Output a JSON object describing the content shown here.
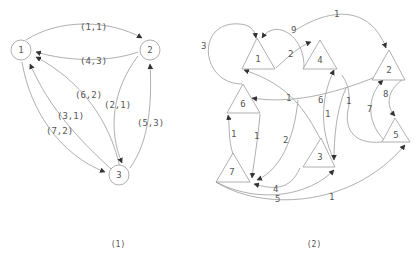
{
  "graph1": {
    "caption": "(1)",
    "nodes": [
      {
        "id": "1",
        "label": "1"
      },
      {
        "id": "2",
        "label": "2"
      },
      {
        "id": "3",
        "label": "3"
      }
    ],
    "edges": [
      {
        "from": "1",
        "to": "2",
        "label": "(1,1)"
      },
      {
        "from": "2",
        "to": "1",
        "label": "(4,3)"
      },
      {
        "from": "3",
        "to": "1",
        "label": "(6,2)"
      },
      {
        "from": "2",
        "to": "3",
        "label": "(2,1)"
      },
      {
        "from": "3",
        "to": "1",
        "label": "(3,1)"
      },
      {
        "from": "1",
        "to": "3",
        "label": "(7,2)"
      },
      {
        "from": "3",
        "to": "2",
        "label": "(5,3)"
      }
    ]
  },
  "graph2": {
    "caption": "(2)",
    "nodes": [
      {
        "id": "1",
        "label": "1"
      },
      {
        "id": "2",
        "label": "2"
      },
      {
        "id": "3",
        "label": "3"
      },
      {
        "id": "4",
        "label": "4"
      },
      {
        "id": "5",
        "label": "5"
      },
      {
        "id": "6",
        "label": "6"
      },
      {
        "id": "7",
        "label": "7"
      }
    ],
    "edges": [
      {
        "from": "6",
        "to": "1",
        "label": "3"
      },
      {
        "from": "4",
        "to": "1",
        "label": "9"
      },
      {
        "from": "1",
        "to": "4",
        "label": "2"
      },
      {
        "from": "1",
        "to": "2",
        "label": "1"
      },
      {
        "from": "3",
        "to": "1",
        "label": "1"
      },
      {
        "from": "2",
        "to": "6",
        "label": "6"
      },
      {
        "from": "3",
        "to": "4",
        "label": "1"
      },
      {
        "from": "5",
        "to": "2",
        "label": "7"
      },
      {
        "from": "2",
        "to": "5",
        "label": "8"
      },
      {
        "from": "5",
        "to": "3",
        "label": "1"
      },
      {
        "from": "7",
        "to": "6",
        "label": "1"
      },
      {
        "from": "6",
        "to": "7",
        "label": "1"
      },
      {
        "from": "4",
        "to": "7",
        "label": "2"
      },
      {
        "from": "3",
        "to": "7",
        "label": "4"
      },
      {
        "from": "7",
        "to": "3",
        "label": "5"
      },
      {
        "from": "7",
        "to": "5",
        "label": "1"
      }
    ]
  }
}
